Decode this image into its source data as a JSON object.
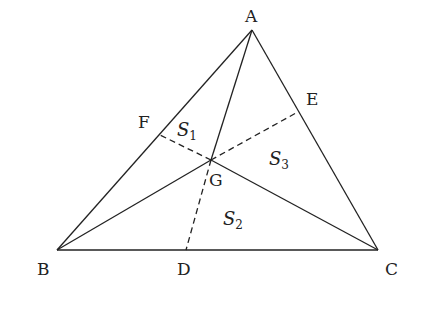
{
  "diagram": {
    "type": "geometry",
    "points": {
      "A": {
        "label": "A",
        "x": 252,
        "y": 30
      },
      "B": {
        "label": "B",
        "x": 57,
        "y": 250
      },
      "C": {
        "label": "C",
        "x": 378,
        "y": 250
      },
      "D": {
        "label": "D",
        "x": 186,
        "y": 250
      },
      "E": {
        "label": "E",
        "x": 296,
        "y": 113
      },
      "F": {
        "label": "F",
        "x": 160,
        "y": 135
      },
      "G": {
        "label": "G",
        "x": 211,
        "y": 160
      }
    },
    "areas": [
      {
        "name": "S",
        "sub": "1"
      },
      {
        "name": "S",
        "sub": "2"
      },
      {
        "name": "S",
        "sub": "3"
      }
    ],
    "segments": {
      "solid": [
        "AB",
        "BC",
        "CA",
        "AG",
        "BG",
        "CG"
      ],
      "dashed": [
        "GD",
        "GE",
        "GF"
      ]
    }
  }
}
